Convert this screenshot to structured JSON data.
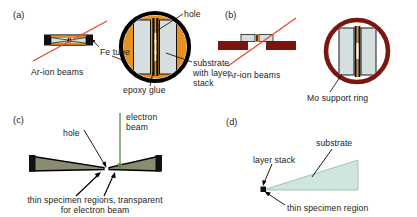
{
  "figure": {
    "kind": "tem-specimen-preparation-schematic",
    "panel_count": 4,
    "background_color": "#ffffff",
    "text_color": "#1a1a1a"
  },
  "colors": {
    "epoxy_orange": "#e8911e",
    "substrate_gray": "#d6dfe0",
    "outline_black": "#000000",
    "ar_beam_red": "#e8452b",
    "mo_ring_darkred": "#7b1510",
    "specimen_olive": "#8b8b72",
    "electron_beam_green": "#5a8a3c",
    "wedge_mint": "#cfe5e0",
    "fe_tube_black": "#111111"
  },
  "panels": {
    "a": {
      "id": "(a)",
      "labels": {
        "ar_beams": "Ar-ion beams",
        "fe_tube": "Fe tube",
        "hole": "hole",
        "epoxy_glue": "epoxy glue",
        "substrate_l1": "substrate",
        "substrate_l2": "with layer",
        "substrate_l3": "stack"
      }
    },
    "b": {
      "id": "(b)",
      "labels": {
        "ar_beams": "Ar-ion beams",
        "mo_ring": "Mo support ring"
      }
    },
    "c": {
      "id": "(c)",
      "labels": {
        "hole": "hole",
        "electron_l1": "electron",
        "electron_l2": "beam",
        "thin_l1": "thin specimen regions, transparent",
        "thin_l2": "for electron beam"
      }
    },
    "d": {
      "id": "(d)",
      "labels": {
        "layer_stack": "layer stack",
        "substrate": "substrate",
        "thin_region": "thin specimen region"
      }
    }
  }
}
